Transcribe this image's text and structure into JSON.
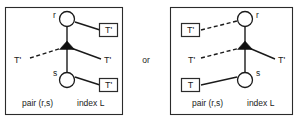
{
  "figure": {
    "connector_text": "or",
    "panels": [
      {
        "id": "left",
        "orientation": "left",
        "nodes": [
          {
            "name": "node-r",
            "label": "r"
          },
          {
            "name": "node-s",
            "label": "s"
          }
        ],
        "boxes": [
          {
            "name": "box-top",
            "label": "T'"
          },
          {
            "name": "box-bottom",
            "label": "T'"
          }
        ],
        "edge_labels": [
          {
            "name": "dashed-edge-label",
            "label": "T'"
          },
          {
            "name": "solid-edge-label",
            "label": "T'"
          }
        ],
        "caption": {
          "pair": "pair (r,s)",
          "index": "index L"
        }
      },
      {
        "id": "right",
        "orientation": "right",
        "nodes": [
          {
            "name": "node-r",
            "label": "r"
          },
          {
            "name": "node-s",
            "label": "s"
          }
        ],
        "boxes": [
          {
            "name": "box-top",
            "label": "T'"
          },
          {
            "name": "box-bottom",
            "label": "T"
          }
        ],
        "edge_labels": [
          {
            "name": "dashed-edge-label",
            "label": "T'"
          },
          {
            "name": "solid-edge-label",
            "label": "T'"
          }
        ],
        "caption": {
          "pair": "pair (r,s)",
          "index": "index L"
        }
      }
    ]
  },
  "colors": {
    "stroke": "#1a1a1a",
    "frame": "#2b2b2b",
    "fill": "#ffffff",
    "arrow": "#111111"
  }
}
